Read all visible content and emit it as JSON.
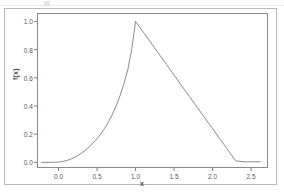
{
  "figure": {
    "background_color": "#ffffff",
    "outer_frame_color": "#b9b9b9",
    "plot_box_color": "#8a8a8a"
  },
  "axes": {
    "y_title": "f(x)",
    "x_title": "x",
    "tick_color": "#585858",
    "y_ticks": [
      "0.0",
      "0.2",
      "0.4",
      "0.6",
      "0.8",
      "1.0"
    ],
    "x_ticks": [
      "0.0",
      "0.5",
      "1.0",
      "1.5",
      "2.0",
      "2.5"
    ]
  },
  "chart_data": {
    "type": "line",
    "title": "",
    "subtitle": "",
    "xlabel": "x",
    "ylabel": "f(x)",
    "xlim": [
      -0.28,
      2.72
    ],
    "ylim": [
      -0.04,
      1.06
    ],
    "xticks": [
      0.0,
      0.5,
      1.0,
      1.5,
      2.0,
      2.5
    ],
    "yticks": [
      0.0,
      0.2,
      0.4,
      0.6,
      0.8,
      1.0
    ],
    "grid": false,
    "legend": null,
    "legend_position": "none",
    "line_color": "#7d7d7d",
    "line_width": 0.9,
    "annotations": [],
    "series": [
      {
        "name": "f(x)",
        "x": [
          -0.22,
          -0.1,
          0.0,
          0.05,
          0.1,
          0.15,
          0.2,
          0.25,
          0.3,
          0.35,
          0.4,
          0.45,
          0.5,
          0.55,
          0.6,
          0.65,
          0.7,
          0.75,
          0.8,
          0.85,
          0.9,
          0.95,
          1.0,
          1.1,
          1.2,
          1.3,
          1.4,
          1.5,
          1.6,
          1.7,
          1.8,
          1.9,
          2.0,
          2.1,
          2.2,
          2.3,
          2.4,
          2.5,
          2.62
        ],
        "y": [
          0.0,
          0.0,
          0.002,
          0.006,
          0.012,
          0.021,
          0.033,
          0.048,
          0.066,
          0.087,
          0.111,
          0.138,
          0.168,
          0.203,
          0.243,
          0.289,
          0.342,
          0.404,
          0.476,
          0.56,
          0.66,
          0.8,
          1.0,
          0.924,
          0.848,
          0.772,
          0.696,
          0.62,
          0.543,
          0.467,
          0.391,
          0.315,
          0.239,
          0.163,
          0.087,
          0.011,
          0.004,
          0.004,
          0.004
        ]
      }
    ]
  }
}
